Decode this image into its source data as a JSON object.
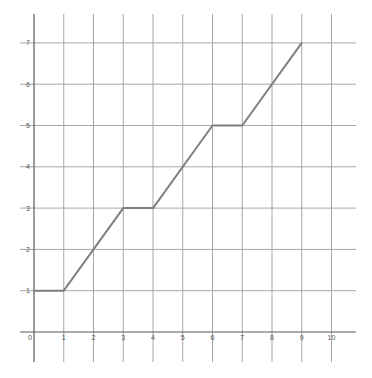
{
  "chart_data": {
    "type": "line",
    "title": "",
    "xlabel": "",
    "ylabel": "",
    "xlim": [
      0,
      10
    ],
    "ylim": [
      0,
      7
    ],
    "grid": true,
    "legend": null,
    "x_ticks": [
      0,
      1,
      2,
      3,
      4,
      5,
      6,
      7,
      8,
      9,
      10
    ],
    "y_ticks": [
      1,
      2,
      3,
      4,
      5,
      6,
      7
    ],
    "x_tick_labels": [
      "0",
      "1",
      "2",
      "3",
      "4",
      "5",
      "6",
      "7",
      "8",
      "9",
      "10"
    ],
    "y_tick_labels": [
      "1",
      "2",
      "3",
      "4",
      "5",
      "6",
      "7"
    ],
    "series": [
      {
        "name": "step-line",
        "x": [
          0,
          1,
          3,
          4,
          6,
          7,
          9
        ],
        "y": [
          1,
          1,
          3,
          3,
          5,
          5,
          7
        ]
      }
    ]
  },
  "colors": {
    "grid": "#a6a6a6",
    "axis": "#595959",
    "line": "#7f7f7f",
    "label": "#555555"
  }
}
